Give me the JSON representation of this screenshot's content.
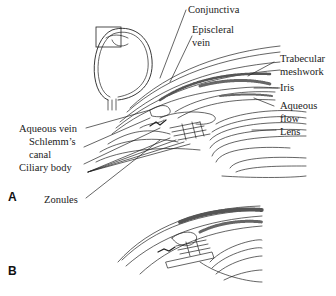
{
  "figure": {
    "panels": [
      {
        "id": "A",
        "label": "A"
      },
      {
        "id": "B",
        "label": "B"
      }
    ],
    "labels": {
      "conjunctiva": "Conjunctiva",
      "episcleral_vein_1": "Episcleral",
      "episcleral_vein_2": "vein",
      "trabecular_meshwork_1": "Trabecular",
      "trabecular_meshwork_2": "meshwork",
      "iris": "Iris",
      "aqueous_flow_1": "Aqueous",
      "aqueous_flow_2": "flow",
      "lens": "Lens",
      "aqueous_vein": "Aqueous vein",
      "schlemms_canal_1": "Schlemm’s",
      "schlemms_canal_2": "canal",
      "ciliary_body": "Ciliary body",
      "zonules": "Zonules"
    },
    "colors": {
      "ink": "#222222",
      "background": "#ffffff"
    }
  }
}
